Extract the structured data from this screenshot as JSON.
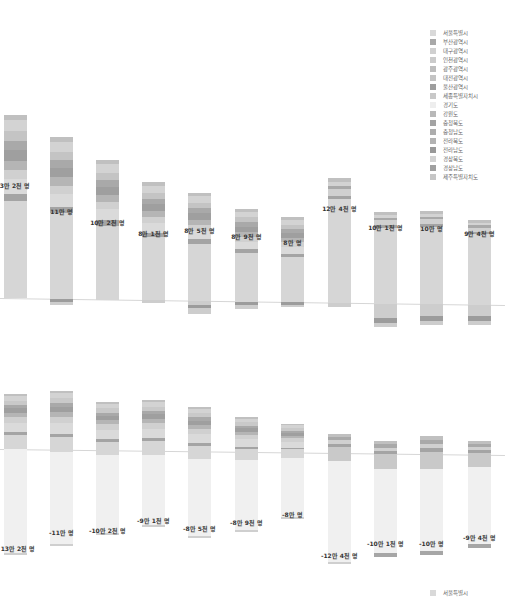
{
  "legend": {
    "items": [
      {
        "label": "서울특별시",
        "color": "#d9d9d9"
      },
      {
        "label": "부산광역시",
        "color": "#a8a8a8"
      },
      {
        "label": "대구광역시",
        "color": "#d0d0d0"
      },
      {
        "label": "인천광역시",
        "color": "#cbcbcb"
      },
      {
        "label": "광주광역시",
        "color": "#bdbdbd"
      },
      {
        "label": "대전광역시",
        "color": "#c4c4c4"
      },
      {
        "label": "울산광역시",
        "color": "#9e9e9e"
      },
      {
        "label": "세종특별자치시",
        "color": "#c8c8c8"
      },
      {
        "label": "경기도",
        "color": "#eeeeee"
      },
      {
        "label": "강원도",
        "color": "#b8b8b8"
      },
      {
        "label": "충청북도",
        "color": "#a3a3a3"
      },
      {
        "label": "충청남도",
        "color": "#adadad"
      },
      {
        "label": "전라북도",
        "color": "#b3b3b3"
      },
      {
        "label": "전라남도",
        "color": "#999999"
      },
      {
        "label": "경상북도",
        "color": "#d3d3d3"
      },
      {
        "label": "경상남도",
        "color": "#a0a0a0"
      },
      {
        "label": "제주특별자치도",
        "color": "#c6c6c6"
      }
    ]
  },
  "bottom_legend": {
    "label": "서울특별시",
    "color": "#d9d9d9"
  },
  "chart_data": [
    {
      "type": "bar",
      "stacked": true,
      "title": "",
      "xlabel": "",
      "ylabel": "",
      "grid": false,
      "legend_position": "top-right",
      "categories": [
        "1",
        "2",
        "3",
        "4",
        "5",
        "6",
        "7",
        "8",
        "9",
        "10",
        "11"
      ],
      "totals_labels": [
        "13만 2천 명",
        "11만 명",
        "10만 2천 명",
        "8만 1천 명",
        "8만 5천 명",
        "8만 9천 명",
        "8만 명",
        "12만 4천 명",
        "10만 1천 명",
        "10만 명",
        "9만 4천 명"
      ],
      "values": [
        132000,
        110000,
        102000,
        81000,
        85000,
        89000,
        80000,
        124000,
        101000,
        100000,
        94000
      ],
      "bars": [
        {
          "top": 115,
          "base": 298,
          "bottom": 298,
          "label_y": 185
        },
        {
          "top": 137,
          "base": 299,
          "bottom": 305,
          "label_y": 211
        },
        {
          "top": 160,
          "base": 300,
          "bottom": 300,
          "label_y": 222
        },
        {
          "top": 182,
          "base": 300,
          "bottom": 303,
          "label_y": 233
        },
        {
          "top": 193,
          "base": 301,
          "bottom": 314,
          "label_y": 230
        },
        {
          "top": 209,
          "base": 302,
          "bottom": 309,
          "label_y": 236
        },
        {
          "top": 217,
          "base": 302,
          "bottom": 307,
          "label_y": 242
        },
        {
          "top": 178,
          "base": 303,
          "bottom": 307,
          "label_y": 208
        },
        {
          "top": 212,
          "base": 304,
          "bottom": 327,
          "label_y": 227
        },
        {
          "top": 211,
          "base": 304,
          "bottom": 325,
          "label_y": 228
        },
        {
          "top": 220,
          "base": 305,
          "bottom": 325,
          "label_y": 233
        }
      ]
    },
    {
      "type": "bar",
      "stacked": true,
      "diverging": true,
      "title": "",
      "xlabel": "",
      "ylabel": "",
      "grid": false,
      "legend_position": "bottom-right",
      "categories": [
        "1",
        "2",
        "3",
        "4",
        "5",
        "6",
        "7",
        "8",
        "9",
        "10",
        "11"
      ],
      "totals_labels": [
        "13만 2천 명",
        "-11만 명",
        "-10만 2천 명",
        "-9만 1천 명",
        "-8만 5천 명",
        "-8만 9천 명",
        "-8만 명",
        "-12만 4천 명",
        "-10만 1천 명",
        "-10만 명",
        "-9만 4천 명"
      ],
      "values": [
        132000,
        -110000,
        -102000,
        -91000,
        -85000,
        -89000,
        -80000,
        -124000,
        -101000,
        -100000,
        -94000
      ],
      "bars": [
        {
          "top": 394,
          "base": 449,
          "dark_end": 449,
          "bottom": 555,
          "label_y": 548
        },
        {
          "top": 391,
          "base": 450,
          "dark_end": 452,
          "bottom": 546,
          "label_y": 532
        },
        {
          "top": 402,
          "base": 451,
          "dark_end": 455,
          "bottom": 535,
          "label_y": 530
        },
        {
          "top": 400,
          "base": 451,
          "dark_end": 455,
          "bottom": 527,
          "label_y": 520
        },
        {
          "top": 407,
          "base": 452,
          "dark_end": 459,
          "bottom": 538,
          "label_y": 528
        },
        {
          "top": 417,
          "base": 452,
          "dark_end": 460,
          "bottom": 532,
          "label_y": 522
        },
        {
          "top": 424,
          "base": 453,
          "dark_end": 458,
          "bottom": 519,
          "label_y": 514
        },
        {
          "top": 434,
          "base": 453,
          "dark_end": 461,
          "bottom": 564,
          "label_y": 555
        },
        {
          "top": 441,
          "base": 454,
          "dark_end": 469,
          "bottom": 557,
          "label_y": 543
        },
        {
          "top": 436,
          "base": 454,
          "dark_end": 469,
          "bottom": 555,
          "label_y": 543
        },
        {
          "top": 441,
          "base": 455,
          "dark_end": 467,
          "bottom": 548,
          "label_y": 537
        }
      ]
    }
  ]
}
